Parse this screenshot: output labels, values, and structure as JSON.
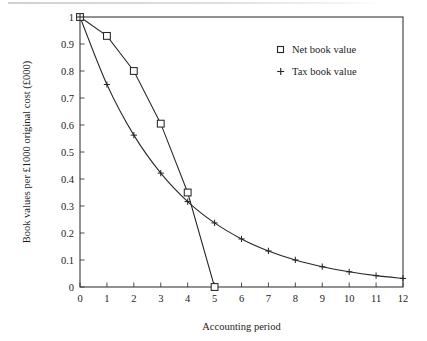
{
  "chart_data": {
    "type": "line",
    "title": "",
    "xlabel": "Accounting period",
    "ylabel": "Book values per £1000 original cost (£000)",
    "xlim": [
      0,
      12
    ],
    "ylim": [
      0,
      1
    ],
    "grid": false,
    "legend_position": "upper right",
    "x_ticks": [
      "0",
      "1",
      "2",
      "3",
      "4",
      "5",
      "6",
      "7",
      "8",
      "9",
      "10",
      "11",
      "12"
    ],
    "y_ticks": [
      "0",
      "0.1",
      "0.2",
      "0.3",
      "0.4",
      "0.5",
      "0.6",
      "0.7",
      "0.8",
      "0.9",
      "1"
    ],
    "x": [
      0,
      1,
      2,
      3,
      4,
      5,
      6,
      7,
      8,
      9,
      10,
      11,
      12
    ],
    "series": [
      {
        "name": "Net book value",
        "marker": "square",
        "x": [
          0,
          1,
          2,
          3,
          4,
          5
        ],
        "values": [
          1.0,
          0.93,
          0.8,
          0.605,
          0.35,
          0.0
        ]
      },
      {
        "name": "Tax book value",
        "marker": "plus",
        "x": [
          0,
          1,
          2,
          3,
          4,
          5,
          6,
          7,
          8,
          9,
          10,
          11,
          12
        ],
        "values": [
          1.0,
          0.75,
          0.5625,
          0.4219,
          0.3164,
          0.2373,
          0.178,
          0.1335,
          0.1001,
          0.0751,
          0.0563,
          0.0422,
          0.0317
        ]
      }
    ]
  },
  "legend": {
    "entries": [
      {
        "label": "Net book value",
        "marker": "square"
      },
      {
        "label": "Tax book value",
        "marker": "plus"
      }
    ]
  },
  "axes": {
    "x_title": "Accounting period",
    "y_title": "Book values per £1000 original cost (£000)"
  },
  "colors": {
    "line": "#262626",
    "frame": "#3a3a3a",
    "text": "#1c1c1c",
    "background": "#ffffff"
  }
}
